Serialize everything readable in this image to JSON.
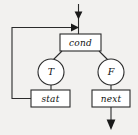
{
  "diagram": {
    "type": "flowchart",
    "canvas": {
      "width": 138,
      "height": 135
    },
    "colors": {
      "background": "#f2f1ef",
      "node_fill": "#ffffff",
      "stroke": "#2b2b2b",
      "arrow": "#1a1a1a",
      "text": "#111111"
    },
    "nodes": [
      {
        "id": "cond",
        "label": "cond",
        "shape": "rectangle",
        "x": 60,
        "y": 34,
        "width": 41,
        "height": 17
      },
      {
        "id": "true-branch",
        "label": "T",
        "shape": "circle",
        "cx": 51,
        "cy": 72,
        "r": 13
      },
      {
        "id": "false-branch",
        "label": "F",
        "shape": "circle",
        "cx": 111,
        "cy": 72,
        "r": 13
      },
      {
        "id": "stat",
        "label": "stat",
        "shape": "rectangle",
        "x": 31,
        "y": 90,
        "width": 39,
        "height": 17
      },
      {
        "id": "next",
        "label": "next",
        "shape": "rectangle",
        "x": 92,
        "y": 90,
        "width": 38,
        "height": 17
      }
    ],
    "edges": [
      {
        "id": "entry",
        "from": "entry-point",
        "to": "cond",
        "label": ""
      },
      {
        "id": "loop-back",
        "from": "stat",
        "to": "cond",
        "label": ""
      },
      {
        "id": "cond-to-true",
        "from": "cond",
        "to": "true-branch",
        "label": ""
      },
      {
        "id": "cond-to-false",
        "from": "cond",
        "to": "false-branch",
        "label": ""
      },
      {
        "id": "true-to-stat",
        "from": "true-branch",
        "to": "stat",
        "label": ""
      },
      {
        "id": "false-to-next",
        "from": "false-branch",
        "to": "next",
        "label": ""
      },
      {
        "id": "exit",
        "from": "next",
        "to": "exit-point",
        "label": ""
      }
    ]
  }
}
